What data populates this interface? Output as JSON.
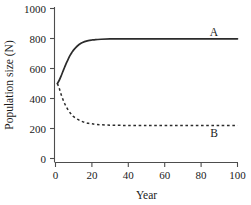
{
  "chart_data": {
    "type": "line",
    "title": "",
    "xlabel": "Year",
    "ylabel": "Population size (N)",
    "xlim": [
      0,
      100
    ],
    "ylim": [
      0,
      1000
    ],
    "xticks": [
      0,
      20,
      40,
      60,
      80,
      100
    ],
    "yticks": [
      0,
      200,
      400,
      600,
      800,
      1000
    ],
    "xtick_labels": [
      "0",
      "20",
      "40",
      "60",
      "80",
      "100"
    ],
    "ytick_labels": [
      "0",
      "200",
      "400",
      "600",
      "800",
      "1000"
    ],
    "grid": false,
    "legend_position": "inline-right",
    "annotations": [
      {
        "text": "A",
        "x": 88,
        "y": 880
      },
      {
        "text": "B",
        "x": 88,
        "y": 175
      }
    ],
    "series": [
      {
        "name": "A",
        "style": "solid",
        "color": "#2b2b2b",
        "x": [
          1,
          2,
          3,
          4,
          5,
          6,
          7,
          8,
          9,
          10,
          12,
          14,
          16,
          18,
          20,
          22,
          25,
          30,
          35,
          40,
          50,
          60,
          70,
          80,
          90,
          100
        ],
        "values": [
          500,
          520,
          548,
          578,
          608,
          637,
          663,
          687,
          707,
          724,
          750,
          768,
          779,
          786,
          790,
          793,
          795,
          797,
          797,
          798,
          798,
          798,
          798,
          798,
          798,
          798
        ]
      },
      {
        "name": "B",
        "style": "dashed",
        "color": "#2b2b2b",
        "x": [
          1,
          2,
          3,
          4,
          5,
          6,
          7,
          8,
          9,
          10,
          12,
          14,
          16,
          18,
          20,
          22,
          25,
          30,
          35,
          40,
          50,
          60,
          70,
          80,
          90,
          100
        ],
        "values": [
          500,
          470,
          430,
          396,
          367,
          343,
          322,
          305,
          291,
          279,
          262,
          250,
          241,
          235,
          231,
          228,
          225,
          222,
          221,
          220,
          220,
          220,
          220,
          220,
          220,
          220
        ]
      }
    ]
  },
  "axis": {
    "y_title": "Population size (N)",
    "x_title": "Year"
  },
  "labels": {
    "series_a": "A",
    "series_b": "B"
  },
  "ytick_0": "0",
  "ytick_200": "200",
  "ytick_400": "400",
  "ytick_600": "600",
  "ytick_800": "800",
  "ytick_1000": "1000",
  "xtick_0": "0",
  "xtick_20": "20",
  "xtick_40": "40",
  "xtick_60": "60",
  "xtick_80": "80",
  "xtick_100": "100"
}
